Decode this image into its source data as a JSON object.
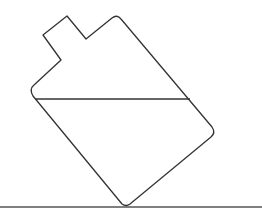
{
  "diagram": {
    "colors": {
      "background": "#ffffff",
      "stroke": "#333333",
      "ground": "#555555"
    },
    "elements": [
      {
        "name": "container-outline",
        "type": "closed-path"
      },
      {
        "name": "liquid-surface-line",
        "type": "horizontal-line"
      },
      {
        "name": "ground-line",
        "type": "horizontal-line"
      }
    ]
  }
}
